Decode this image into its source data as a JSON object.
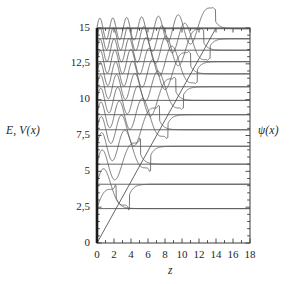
{
  "figure": {
    "axis_label_left": "E, V(x)",
    "axis_label_right": "ψ(x)",
    "axis_label_bottom": "z"
  },
  "chart_data": {
    "type": "line",
    "title": "",
    "xlabel": "z",
    "ylabel": "E, V(x)",
    "right_label": "ψ(x)",
    "xlim": [
      0,
      18
    ],
    "ylim": [
      0,
      15
    ],
    "xticks": [
      0,
      2,
      4,
      6,
      8,
      10,
      12,
      14,
      16,
      18
    ],
    "xticklabels": [
      "0",
      "2",
      "4",
      "6",
      "8",
      "10",
      "12",
      "14",
      "16",
      "18"
    ],
    "yticks": [
      0,
      2.5,
      5,
      7.5,
      10,
      12.5,
      15
    ],
    "yticklabels": [
      "0",
      "2,5",
      "5",
      "7,5",
      "10",
      "12,5",
      "15"
    ],
    "xminor_step": 1,
    "grid": false,
    "legend": false,
    "decimal_separator": ",",
    "potential": {
      "name": "V(z)",
      "form": "linear",
      "slope": 1.0714,
      "intercept": 0,
      "x_at_ymax": 14.0,
      "description": "Straight line from origin rising to E=15 at z=14; left wall is an infinite barrier at z=0"
    },
    "series": [
      {
        "name": "n=1",
        "energy": 2.4,
        "nodes": 0,
        "turning_point": 2.24,
        "amplitude": 0.7
      },
      {
        "name": "n=2",
        "energy": 4.1,
        "nodes": 1,
        "turning_point": 3.83,
        "amplitude": 0.66
      },
      {
        "name": "n=3",
        "energy": 5.5,
        "nodes": 2,
        "turning_point": 5.13,
        "amplitude": 0.62
      },
      {
        "name": "n=4",
        "energy": 6.75,
        "nodes": 3,
        "turning_point": 6.3,
        "amplitude": 0.6
      },
      {
        "name": "n=5",
        "energy": 7.9,
        "nodes": 4,
        "turning_point": 7.37,
        "amplitude": 0.58
      },
      {
        "name": "n=6",
        "energy": 8.95,
        "nodes": 5,
        "turning_point": 8.35,
        "amplitude": 0.56
      },
      {
        "name": "n=7",
        "energy": 9.95,
        "nodes": 6,
        "turning_point": 9.29,
        "amplitude": 0.54
      },
      {
        "name": "n=8",
        "energy": 10.9,
        "nodes": 7,
        "turning_point": 10.17,
        "amplitude": 0.52
      },
      {
        "name": "n=9",
        "energy": 11.8,
        "nodes": 8,
        "turning_point": 11.01,
        "amplitude": 0.51
      },
      {
        "name": "n=10",
        "energy": 12.65,
        "nodes": 9,
        "turning_point": 11.81,
        "amplitude": 0.5
      },
      {
        "name": "n=11",
        "energy": 13.45,
        "nodes": 10,
        "turning_point": 12.55,
        "amplitude": 0.49
      },
      {
        "name": "n=12",
        "energy": 14.25,
        "nodes": 11,
        "turning_point": 13.3,
        "amplitude": 0.48
      },
      {
        "name": "n=13",
        "energy": 14.95,
        "nodes": 12,
        "turning_point": 13.95,
        "amplitude": 0.47
      }
    ],
    "colors": {
      "frame": "#3c3c3c",
      "wall": "#1a1a1a",
      "potential_line": "#555555",
      "baseline": "#4a4a4a",
      "wavefunction": "#555555",
      "text": "#1f1f1f"
    }
  }
}
